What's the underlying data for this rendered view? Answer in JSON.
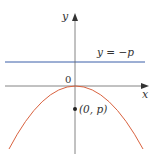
{
  "figure": {
    "axes": {
      "x_label": "x",
      "y_label": "y",
      "origin_label": "0",
      "axis_color": "#666666"
    },
    "directrix": {
      "label": "y = −p",
      "color": "#3b5fa8"
    },
    "parabola": {
      "color": "#d9623f",
      "opens": "down",
      "vertex_label": "0"
    },
    "focus": {
      "label": "(0, p)",
      "color": "#222222"
    }
  }
}
